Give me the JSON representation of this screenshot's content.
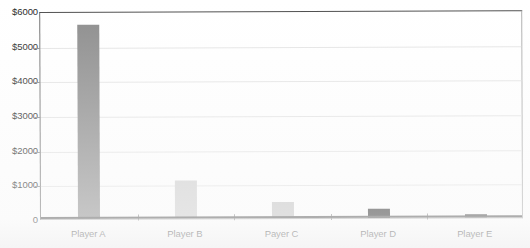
{
  "chart_data": {
    "type": "bar",
    "title": "",
    "subtitle": "",
    "xlabel": "",
    "ylabel": "",
    "categories": [
      "Player A",
      "Player B",
      "Payer C",
      "Player D",
      "Player E"
    ],
    "values": [
      5600,
      1100,
      450,
      260,
      90
    ],
    "series": [
      {
        "name": "Amount",
        "values": [
          5600,
          1100,
          450,
          260,
          90
        ]
      }
    ],
    "bar_colors": [
      "#8c8c8c",
      "#cfcfcf",
      "#c4c4c4",
      "#2b2b2b",
      "#3a3a3a"
    ],
    "ylim": [
      0,
      6000
    ],
    "ytick_values": [
      0,
      1000,
      2000,
      3000,
      4000,
      5000,
      6000
    ],
    "ytick_labels": [
      "0",
      "$1000",
      "$2000",
      "$3000",
      "$4000",
      "$5000",
      "$6000"
    ],
    "grid": true,
    "grid_axis": "y",
    "legend": false,
    "legend_position": "none",
    "currency_prefix": "$",
    "axis_color": "#545454",
    "gridline_color": "#e4e4e4",
    "plot_background": "#ffffff",
    "annotations": []
  }
}
